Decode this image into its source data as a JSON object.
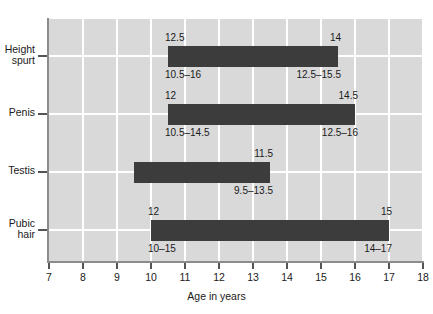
{
  "chart_data": {
    "type": "bar",
    "title": "",
    "subtitle": "",
    "xlabel": "Age in years",
    "ylabel": "",
    "xlim": [
      7,
      18
    ],
    "xticks": [
      7,
      8,
      9,
      10,
      11,
      12,
      13,
      14,
      15,
      16,
      17,
      18
    ],
    "xtick_labels": [
      "7",
      "8",
      "9",
      "10",
      "11",
      "12",
      "13",
      "14",
      "15",
      "16",
      "17",
      "18"
    ],
    "grid": true,
    "legend": "none",
    "orientation": "horizontal",
    "categories": [
      "Height spurt",
      "Penis",
      "Testis",
      "Pubic hair"
    ],
    "series": [
      {
        "name": "Average age range",
        "bars": [
          {
            "category": "Height spurt",
            "category_label": "Height\nspurt",
            "start": 10.5,
            "end": 15.5,
            "label_start_top": "12.5",
            "label_end_top": "14",
            "label_start_bottom": "10.5–16",
            "label_end_bottom": "12.5–15.5"
          },
          {
            "category": "Penis",
            "category_label": "Penis",
            "start": 10.5,
            "end": 16,
            "label_start_top": "12",
            "label_end_top": "14.5",
            "label_start_bottom": "10.5–14.5",
            "label_end_bottom": "12.5–16"
          },
          {
            "category": "Testis",
            "category_label": "Testis",
            "start": 9.5,
            "end": 13.5,
            "label_start_top": "",
            "label_end_top": "11.5",
            "label_start_bottom": "",
            "label_end_bottom": "9.5–13.5"
          },
          {
            "category": "Pubic hair",
            "category_label": "Pubic\nhair",
            "start": 10,
            "end": 17,
            "label_start_top": "12",
            "label_end_top": "15",
            "label_start_bottom": "10–15",
            "label_end_bottom": "14–17"
          }
        ]
      }
    ],
    "colors": {
      "bar": "#3c3c3c",
      "plot_background": "#d9d9d9",
      "gridline": "#ffffff",
      "axis": "#8c8c8c",
      "text": "#1a1a1a",
      "page_background": "#ffffff"
    }
  }
}
